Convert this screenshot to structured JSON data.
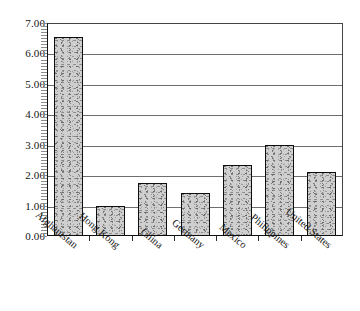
{
  "chart_data": {
    "type": "bar",
    "title": "",
    "subtitle": "",
    "xlabel": "",
    "ylabel": "",
    "categories": [
      "Afghanistan",
      "Hong Kong",
      "China",
      "Germany",
      "Mexico",
      "Philippines",
      "United States"
    ],
    "values": [
      6.55,
      0.98,
      1.75,
      1.4,
      2.35,
      2.98,
      2.1
    ],
    "ylim": [
      0,
      7
    ],
    "ytick_step": 1,
    "ytick_labels": [
      "0.00",
      "1.00",
      "2.00",
      "3.00",
      "4.00",
      "5.00",
      "6.00",
      "7.00"
    ],
    "ytick_values": [
      0,
      1,
      2,
      3,
      4,
      5,
      6,
      7
    ],
    "grid": true,
    "grid_axis": "y",
    "legend": false,
    "legend_position": "none",
    "annotations": [],
    "series": [
      {
        "name": "",
        "values": [
          6.55,
          0.98,
          1.75,
          1.4,
          2.35,
          2.98,
          2.1
        ]
      }
    ],
    "style": {
      "bar_fill": "#cfcfcf",
      "bar_border": "#0d0d0d",
      "gridline_color": "#6e6e6e",
      "axis_color": "#111111",
      "text_color": "#141414",
      "background": "#ffffff"
    }
  }
}
